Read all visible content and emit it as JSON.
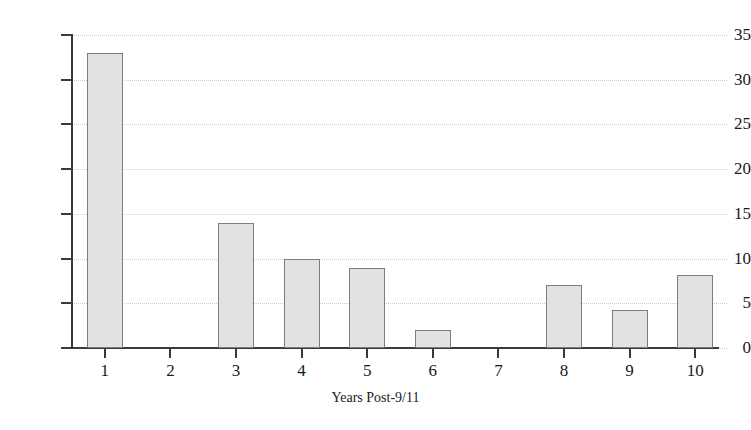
{
  "chart_data": {
    "type": "bar",
    "title": "",
    "subtitle": "",
    "xlabel": "Years Post-9/11",
    "ylabel": "",
    "categories": [
      "1",
      "2",
      "3",
      "4",
      "5",
      "6",
      "7",
      "8",
      "9",
      "10"
    ],
    "values": [
      33,
      0,
      14,
      10,
      9,
      2,
      0,
      7,
      4.2,
      8.2
    ],
    "series": [
      {
        "name": "",
        "values": [
          33,
          0,
          14,
          10,
          9,
          2,
          0,
          7,
          4.2,
          8.2
        ]
      }
    ],
    "ylim": [
      0,
      35
    ],
    "yticks": [
      0,
      5,
      10,
      15,
      20,
      25,
      30,
      35
    ],
    "ytick_labels": [
      "0",
      "5",
      "10",
      "15",
      "20",
      "25",
      "30",
      "35"
    ],
    "grid": true,
    "grid_axis": "y",
    "legend": false,
    "legend_position": "none",
    "colors": {
      "bar_fill": "#e2e2e2",
      "bar_border": "#7d7d7d",
      "axis": "#3a3a3a",
      "gridline": "#c8c8c8",
      "text": "#1a1a1a",
      "background": "#ffffff"
    }
  }
}
